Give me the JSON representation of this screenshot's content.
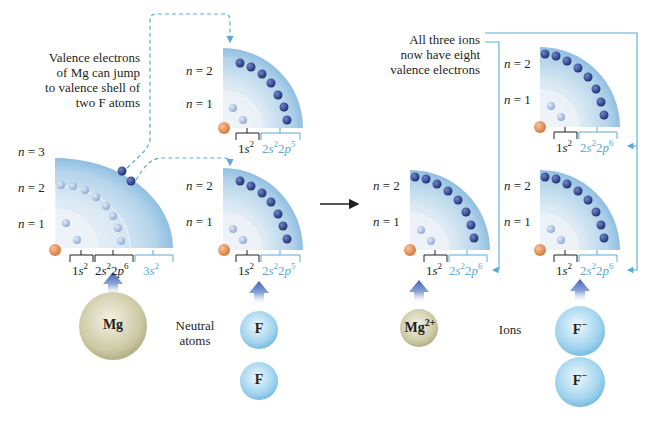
{
  "left_panel": {
    "note": [
      "Valence electrons",
      "of Mg can jump",
      "to valence shell of",
      "two F atoms"
    ],
    "mg_shells": {
      "n3": "n = 3",
      "n2": "n = 2",
      "n1": "n = 1"
    },
    "mg_config": {
      "core1": "1s",
      "core1_sup": "2",
      "core2a": "2s",
      "core2a_sup": "2",
      "core2b": "2p",
      "core2b_sup": "6",
      "valence": "3s",
      "valence_sup": "2"
    },
    "f_top_shells": {
      "n2": "n = 2",
      "n1": "n = 1"
    },
    "f_top_config": {
      "core": "1s",
      "core_sup": "2",
      "val_a": "2s",
      "val_a_sup": "2",
      "val_b": "2p",
      "val_b_sup": "5"
    },
    "f_bot_shells": {
      "n2": "n = 2",
      "n1": "n = 1"
    },
    "f_bot_config": {
      "core": "1s",
      "core_sup": "2",
      "val_a": "2s",
      "val_a_sup": "2",
      "val_b": "2p",
      "val_b_sup": "5"
    },
    "mg_ball": "Mg",
    "f_ball_1": "F",
    "f_ball_2": "F",
    "caption": [
      "Neutral",
      "atoms"
    ]
  },
  "right_panel": {
    "note": [
      "All three ions",
      "now have eight",
      "valence electrons"
    ],
    "mg_shells": {
      "n2": "n = 2",
      "n1": "n = 1"
    },
    "mg_config": {
      "core": "1s",
      "core_sup": "2",
      "val_a": "2s",
      "val_a_sup": "2",
      "val_b": "2p",
      "val_b_sup": "6"
    },
    "f_top_shells": {
      "n2": "n = 2",
      "n1": "n = 1"
    },
    "f_top_config": {
      "core": "1s",
      "core_sup": "2",
      "val_a": "2s",
      "val_a_sup": "2",
      "val_b": "2p",
      "val_b_sup": "6"
    },
    "f_bot_shells": {
      "n2": "n = 2",
      "n1": "n = 1"
    },
    "f_bot_config": {
      "core": "1s",
      "core_sup": "2",
      "val_a": "2s",
      "val_a_sup": "2",
      "val_b": "2p",
      "val_b_sup": "6"
    },
    "mg_ball": "Mg",
    "mg_ball_charge": "2+",
    "f_ball_1": "F",
    "f_ball_1_charge": "−",
    "f_ball_2": "F",
    "f_ball_2_charge": "−",
    "caption": "Ions"
  },
  "colors": {
    "accent_blue": "#5aa9d6",
    "shell_fill": "#a9cfe8",
    "electron_dark": "#2a3f8a",
    "electron_light": "#9fb7dc",
    "nucleus": "#e08a4a",
    "mg_ball": "#c9c6a0",
    "f_ball": "#8fcbea"
  }
}
